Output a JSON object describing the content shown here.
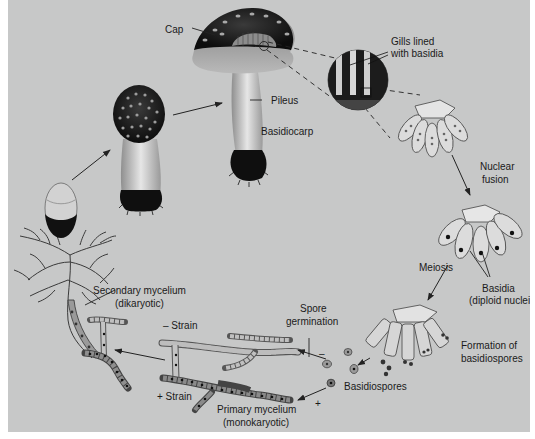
{
  "diagram": {
    "background": "#c7c8c8",
    "labels": {
      "cap": "Cap",
      "gills_line1": "Gills lined",
      "gills_line2": "with basidia",
      "pileus": "Pileus",
      "basidiocarp": "Basidiocarp",
      "nuclear_fusion_line1": "Nuclear",
      "nuclear_fusion_line2": "fusion",
      "meiosis": "Meiosis",
      "basidia_line1": "Basidia",
      "basidia_line2": "(diploid nuclei)",
      "formation_line1": "Formation of",
      "formation_line2": "basidiospores",
      "basidiospores": "Basidiospores",
      "spore_germination_line1": "Spore",
      "spore_germination_line2": "germination",
      "minus_sign": "–",
      "plus_sign": "+",
      "minus_strain": "– Strain",
      "plus_strain": "+ Strain",
      "primary_line1": "Primary mycelium",
      "primary_line2": "(monokaryotic)",
      "secondary_line1": "Secondary mycelium",
      "secondary_line2": "(dikaryotic)"
    },
    "stages": [
      "Secondary mycelium (dikaryotic) with button",
      "Young mushroom",
      "Mature basidiocarp",
      "Gills lined with basidia",
      "Nuclear fusion",
      "Meiosis / Basidia (diploid nuclei)",
      "Formation of basidiospores",
      "Basidiospores",
      "Spore germination",
      "Primary mycelium (monokaryotic)"
    ]
  }
}
